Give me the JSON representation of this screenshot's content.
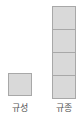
{
  "diagram": {
    "type": "block-stacks",
    "block_color": "#d9d9d9",
    "border_color": "#a8a8a8",
    "stacks": [
      {
        "label": "규성",
        "count": 1
      },
      {
        "label": "규종",
        "count": 4
      }
    ]
  }
}
